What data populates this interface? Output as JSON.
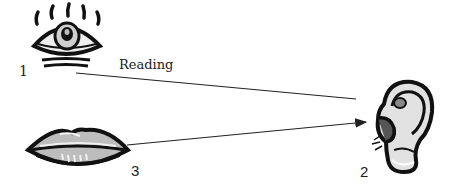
{
  "diagram": {
    "nodes": [
      {
        "id": "eye",
        "number": "1",
        "icon": "eye-icon"
      },
      {
        "id": "ear",
        "number": "2",
        "icon": "ear-icon"
      },
      {
        "id": "mouth",
        "number": "3",
        "icon": "lips-icon"
      }
    ],
    "edges": [
      {
        "from": "eye",
        "to": "ear",
        "label": "Reading",
        "arrow": false
      },
      {
        "from": "mouth",
        "to": "ear",
        "label": "",
        "arrow": true
      }
    ],
    "labels": {
      "eye_number": "1",
      "ear_number": "2",
      "mouth_number": "3",
      "edge_label": "Reading"
    },
    "colors": {
      "line": "#222222",
      "ink": "#111111",
      "fill_gray": "#b8b8b8",
      "light_gray": "#e6e6e6"
    }
  }
}
